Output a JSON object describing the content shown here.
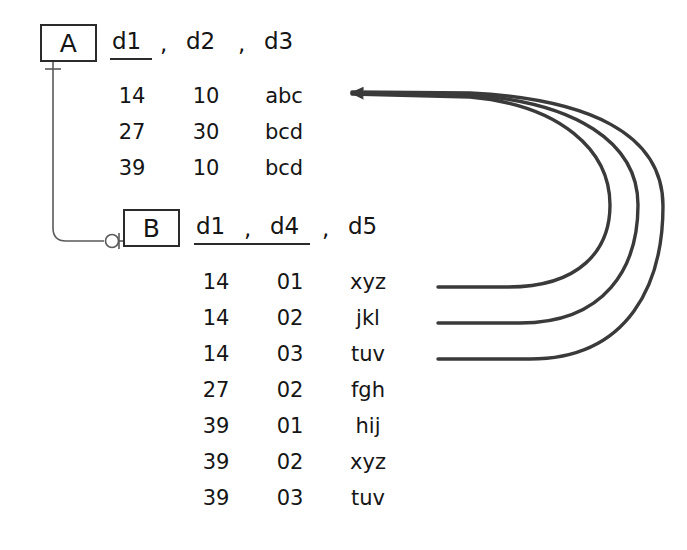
{
  "diagram": {
    "stroke_color": "#2b2b2b",
    "text_color": "#151515",
    "background": "#ffffff"
  },
  "entities": [
    {
      "id": "A",
      "box_label": "A",
      "columns": [
        "d1",
        "d2",
        "d3"
      ],
      "key_columns": [
        "d1"
      ],
      "separator": ",",
      "rows": [
        [
          "14",
          "10",
          "abc"
        ],
        [
          "27",
          "30",
          "bcd"
        ],
        [
          "39",
          "10",
          "bcd"
        ]
      ]
    },
    {
      "id": "B",
      "box_label": "B",
      "columns": [
        "d1",
        "d4",
        "d5"
      ],
      "key_columns": [
        "d1",
        "d4"
      ],
      "separator": ",",
      "rows": [
        [
          "14",
          "01",
          "xyz"
        ],
        [
          "14",
          "02",
          "jkl"
        ],
        [
          "14",
          "03",
          "tuv"
        ],
        [
          "27",
          "02",
          "fgh"
        ],
        [
          "39",
          "01",
          "hij"
        ],
        [
          "39",
          "02",
          "xyz"
        ],
        [
          "39",
          "03",
          "tuv"
        ]
      ]
    }
  ],
  "relationship": {
    "from": "A",
    "to": "B",
    "from_cardinality": "one",
    "to_cardinality": "zero-or-one"
  },
  "reference_arrows": [
    {
      "source_row": 1,
      "source_value": "xyz",
      "target_row": 1,
      "target_value": "abc"
    },
    {
      "source_row": 2,
      "source_value": "jkl",
      "target_row": 1,
      "target_value": "abc"
    },
    {
      "source_row": 3,
      "source_value": "tuv",
      "target_row": 1,
      "target_value": "abc"
    }
  ]
}
